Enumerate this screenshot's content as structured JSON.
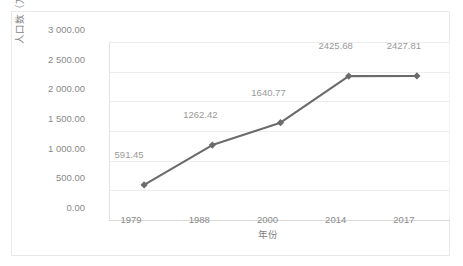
{
  "chart_data": {
    "type": "line",
    "title": "",
    "categories": [
      "1979",
      "1988",
      "2000",
      "2014",
      "2017"
    ],
    "values": [
      591.45,
      1262.42,
      1640.77,
      2425.68,
      2427.81
    ],
    "point_labels": [
      "591.45",
      "1262.42",
      "1640.77",
      "2425.68",
      "2427.81"
    ],
    "xlabel": "年份",
    "ylabel": "人口数（万人）",
    "ylim": [
      0,
      3000
    ],
    "ytick_values": [
      0,
      500,
      1000,
      1500,
      2000,
      2500,
      3000
    ],
    "ytick_labels": [
      "0.00",
      "500.00",
      "1 000.00",
      "1 500.00",
      "2 000.00",
      "2 500.00",
      "3 000.00"
    ],
    "grid": true,
    "legend": "none",
    "series_color": "#6b6b6b",
    "marker": "diamond",
    "label_color": "#9a9a9a",
    "axis_text_color": "#8a8a8a",
    "gridline_color": "#ededed",
    "frame_color": "#e9e9e9",
    "background": "#ffffff"
  }
}
